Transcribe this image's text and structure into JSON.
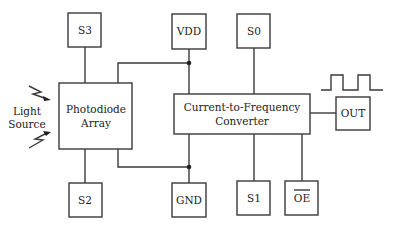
{
  "diagram": {
    "pins": {
      "s3": "S3",
      "vdd": "VDD",
      "s0": "S0",
      "s2": "S2",
      "gnd": "GND",
      "s1": "S1",
      "oe": "OE",
      "out": "OUT"
    },
    "blocks": {
      "photodiode_line1": "Photodiode",
      "photodiode_line2": "Array",
      "converter_line1": "Current-to-Frequency",
      "converter_line2": "Converter"
    },
    "light_source": {
      "line1": "Light",
      "line2": "Source"
    },
    "colors": {
      "stroke": "#3a3a3a",
      "text": "#222222",
      "background": "#ffffff"
    }
  }
}
